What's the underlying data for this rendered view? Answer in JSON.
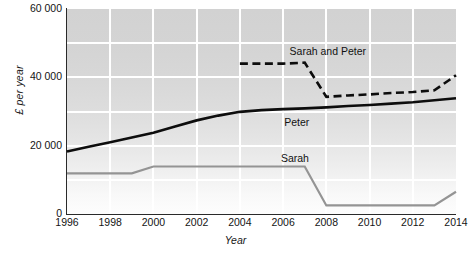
{
  "chart_data": {
    "type": "line",
    "title": "",
    "xlabel": "Year",
    "ylabel": "£ per year",
    "xlim": [
      1996,
      2014
    ],
    "ylim": [
      0,
      60000
    ],
    "grid": true,
    "legend_position": "inline-labels",
    "x_ticks": [
      {
        "value": 1996,
        "label": "1996"
      },
      {
        "value": 1998,
        "label": "1998"
      },
      {
        "value": 2000,
        "label": "2000"
      },
      {
        "value": 2002,
        "label": "2002"
      },
      {
        "value": 2004,
        "label": "2004"
      },
      {
        "value": 2006,
        "label": "2006"
      },
      {
        "value": 2008,
        "label": "2008"
      },
      {
        "value": 2010,
        "label": "2010"
      },
      {
        "value": 2012,
        "label": "2012"
      },
      {
        "value": 2014,
        "label": "2014"
      }
    ],
    "y_ticks": [
      {
        "value": 0,
        "label": "0"
      },
      {
        "value": 20000,
        "label": "20 000"
      },
      {
        "value": 40000,
        "label": "40 000"
      },
      {
        "value": 60000,
        "label": "60 000"
      }
    ],
    "series": [
      {
        "name": "Peter",
        "style": "solid",
        "color": "#0d0d0d",
        "width": 2.6,
        "label_x": 2006.05,
        "label_y": 26500,
        "x": [
          1996,
          1997,
          1998,
          1999,
          2000,
          2001,
          2002,
          2003,
          2004,
          2005,
          2006,
          2007,
          2008,
          2009,
          2010,
          2011,
          2012,
          2013,
          2014
        ],
        "values": [
          18300,
          19700,
          21000,
          22400,
          23800,
          25600,
          27400,
          28800,
          29900,
          30400,
          30700,
          30900,
          31200,
          31600,
          31900,
          32300,
          32700,
          33300,
          33900
        ]
      },
      {
        "name": "Sarah and Peter",
        "style": "dashed",
        "color": "#0d0d0d",
        "width": 2.6,
        "label_x": 2006.3,
        "label_y": 47400,
        "x": [
          2004,
          2005,
          2006,
          2007,
          2008,
          2009,
          2010,
          2011,
          2012,
          2013,
          2014
        ],
        "values": [
          44000,
          44000,
          44000,
          44300,
          34300,
          34700,
          35000,
          35400,
          35700,
          36200,
          40600
        ]
      },
      {
        "name": "Sarah",
        "style": "solid",
        "color": "#949494",
        "width": 2.2,
        "label_x": 2005.9,
        "label_y": 16200,
        "x": [
          1996,
          1997,
          1998,
          1999,
          2000,
          2001,
          2002,
          2003,
          2004,
          2005,
          2006,
          2007,
          2008,
          2009,
          2010,
          2011,
          2012,
          2013,
          2014
        ],
        "values": [
          11900,
          11900,
          11900,
          11900,
          13900,
          13900,
          13900,
          13900,
          13900,
          13900,
          13900,
          13900,
          2500,
          2500,
          2500,
          2500,
          2500,
          2500,
          6500
        ]
      }
    ],
    "gridlines_y": [
      10000,
      20000,
      30000,
      40000,
      50000
    ],
    "gridlines_x": [
      1998,
      2000,
      2002,
      2004,
      2006,
      2008,
      2010,
      2012
    ]
  },
  "caption": "",
  "colors": {
    "plot_background_top": "#d2d2d2",
    "plot_background_bottom": "#fdfdfd",
    "gridline": "#ffffff",
    "axis": "#2a2a2a",
    "series_dark": "#0d0d0d",
    "series_grey": "#949494"
  }
}
